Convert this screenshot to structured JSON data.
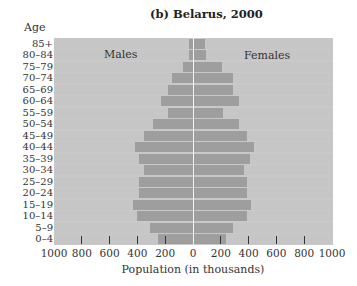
{
  "chart_data": {
    "type": "bar",
    "subtype": "population-pyramid",
    "title": "(b) Belarus, 2000",
    "xlabel": "Population (in thousands)",
    "ylabel": "Age",
    "xlim": [
      -1000,
      1000
    ],
    "x_ticks": [
      "1000",
      "800",
      "600",
      "400",
      "200",
      "0",
      "200",
      "400",
      "600",
      "800",
      "1000"
    ],
    "grid": false,
    "legend": null,
    "annotations": [
      "Males",
      "Females"
    ],
    "categories": [
      "85+",
      "80–84",
      "75–79",
      "70–74",
      "65–69",
      "60–64",
      "55–59",
      "50–54",
      "45–49",
      "40–44",
      "35–39",
      "30–34",
      "25–29",
      "20–24",
      "15–19",
      "10–14",
      "5–9",
      "0–4"
    ],
    "series": [
      {
        "name": "Males",
        "side": "left",
        "color": "#9e9e9e",
        "values": [
          30,
          30,
          70,
          150,
          180,
          230,
          180,
          290,
          350,
          420,
          390,
          350,
          390,
          390,
          430,
          400,
          310,
          250
        ]
      },
      {
        "name": "Females",
        "side": "right",
        "color": "#9e9e9e",
        "values": [
          85,
          90,
          210,
          290,
          290,
          330,
          215,
          330,
          390,
          440,
          410,
          370,
          390,
          390,
          415,
          385,
          285,
          240
        ]
      }
    ]
  },
  "labels": {
    "title": "(b) Belarus, 2000",
    "age_header": "Age",
    "males": "Males",
    "females": "Females",
    "x_title": "Population (in thousands)"
  }
}
